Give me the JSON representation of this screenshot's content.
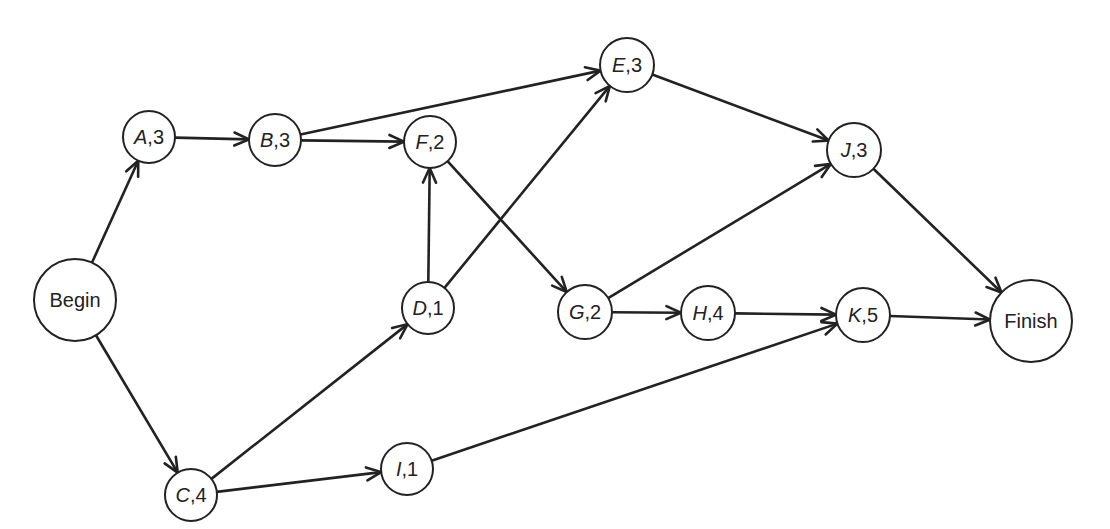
{
  "diagram": {
    "type": "activity-on-node network",
    "colors": {
      "stroke": "#222222",
      "fill": "#ffffff",
      "background": "#ffffff"
    },
    "nodes": [
      {
        "id": "Begin",
        "label": "Begin",
        "letter": "",
        "duration": "",
        "x": 75,
        "y": 300,
        "r": 41
      },
      {
        "id": "A",
        "label": "A,3",
        "letter": "A",
        "duration": "3",
        "x": 149,
        "y": 137,
        "r": 26
      },
      {
        "id": "B",
        "label": "B,3",
        "letter": "B",
        "duration": "3",
        "x": 275,
        "y": 140,
        "r": 26
      },
      {
        "id": "C",
        "label": "C,4",
        "letter": "C",
        "duration": "4",
        "x": 191,
        "y": 495,
        "r": 26
      },
      {
        "id": "D",
        "label": "D,1",
        "letter": "D",
        "duration": "1",
        "x": 428,
        "y": 308,
        "r": 26
      },
      {
        "id": "E",
        "label": "E,3",
        "letter": "E",
        "duration": "3",
        "x": 627,
        "y": 65,
        "r": 27
      },
      {
        "id": "F",
        "label": "F,2",
        "letter": "F",
        "duration": "2",
        "x": 430,
        "y": 142,
        "r": 26
      },
      {
        "id": "G",
        "label": "G,2",
        "letter": "G",
        "duration": "2",
        "x": 585,
        "y": 312,
        "r": 27
      },
      {
        "id": "H",
        "label": "H,4",
        "letter": "H",
        "duration": "4",
        "x": 708,
        "y": 313,
        "r": 27
      },
      {
        "id": "I",
        "label": "I,1",
        "letter": "I",
        "duration": "1",
        "x": 407,
        "y": 469,
        "r": 26
      },
      {
        "id": "J",
        "label": "J,3",
        "letter": "J",
        "duration": "3",
        "x": 854,
        "y": 150,
        "r": 27
      },
      {
        "id": "K",
        "label": "K,5",
        "letter": "K",
        "duration": "5",
        "x": 863,
        "y": 315,
        "r": 27
      },
      {
        "id": "Finish",
        "label": "Finish",
        "letter": "",
        "duration": "",
        "x": 1031,
        "y": 321,
        "r": 41
      }
    ],
    "edges": [
      {
        "from": "Begin",
        "to": "A"
      },
      {
        "from": "Begin",
        "to": "C"
      },
      {
        "from": "A",
        "to": "B"
      },
      {
        "from": "B",
        "to": "F"
      },
      {
        "from": "B",
        "to": "E"
      },
      {
        "from": "C",
        "to": "D"
      },
      {
        "from": "C",
        "to": "I"
      },
      {
        "from": "D",
        "to": "F"
      },
      {
        "from": "D",
        "to": "E"
      },
      {
        "from": "F",
        "to": "G"
      },
      {
        "from": "E",
        "to": "J"
      },
      {
        "from": "G",
        "to": "J"
      },
      {
        "from": "G",
        "to": "H"
      },
      {
        "from": "H",
        "to": "K"
      },
      {
        "from": "I",
        "to": "K"
      },
      {
        "from": "J",
        "to": "Finish"
      },
      {
        "from": "K",
        "to": "Finish"
      }
    ]
  }
}
